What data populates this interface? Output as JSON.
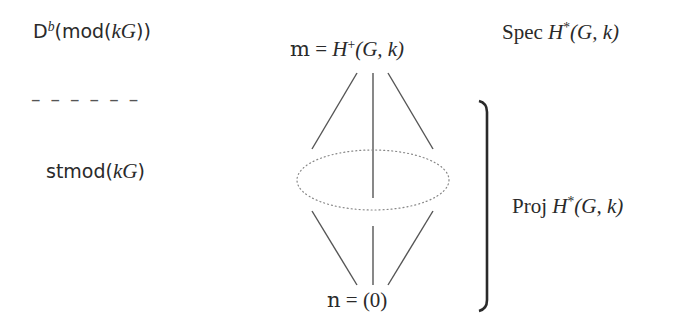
{
  "left_column": {
    "derived_category": {
      "base": "D",
      "sup": "b",
      "arg_prefix": "(mod(",
      "arg_var": "kG",
      "arg_suffix": "))"
    },
    "separator": "– – – – – –",
    "stable_category": {
      "base": "stmod(",
      "arg_var": "kG",
      "arg_suffix": ")"
    }
  },
  "center_column": {
    "top_label": {
      "frak": "m",
      "eq": " = ",
      "H": "H",
      "sup": "+",
      "args": "(G, k)"
    },
    "bottom_label": {
      "frak": "n",
      "eq": " = ",
      "value": "(0)"
    }
  },
  "right_column": {
    "spec_label": {
      "op": "Spec ",
      "H": "H",
      "sup": "*",
      "args": "(G, k)"
    },
    "proj_label": {
      "op": "Proj ",
      "H": "H",
      "sup": "*",
      "args": "(G, k)"
    }
  },
  "colors": {
    "text": "#2a2a2a",
    "lines": "#555555",
    "dotted": "#888888"
  }
}
